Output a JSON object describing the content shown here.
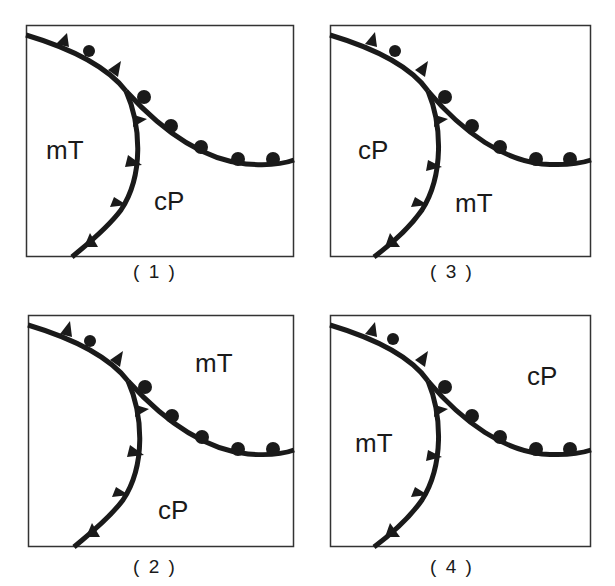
{
  "figure": {
    "colors": {
      "line": "#1a1a1a",
      "background": "#ffffff",
      "border": "#333333"
    },
    "panels": [
      {
        "id": "1",
        "caption": "( 1 )",
        "labels": [
          {
            "text": "mT",
            "region": "left"
          },
          {
            "text": "cP",
            "region": "lower-right"
          }
        ]
      },
      {
        "id": "3",
        "caption": "( 3 )",
        "labels": [
          {
            "text": "cP",
            "region": "left"
          },
          {
            "text": "mT",
            "region": "lower-right"
          }
        ]
      },
      {
        "id": "2",
        "caption": "( 2 )",
        "labels": [
          {
            "text": "mT",
            "region": "upper-right"
          },
          {
            "text": "cP",
            "region": "lower-right"
          }
        ]
      },
      {
        "id": "4",
        "caption": "( 4 )",
        "labels": [
          {
            "text": "cP",
            "region": "upper-right"
          },
          {
            "text": "mT",
            "region": "left"
          }
        ]
      }
    ],
    "legend_symbols": {
      "cold_front": "triangle-icon",
      "warm_front": "semicircle-icon"
    }
  }
}
